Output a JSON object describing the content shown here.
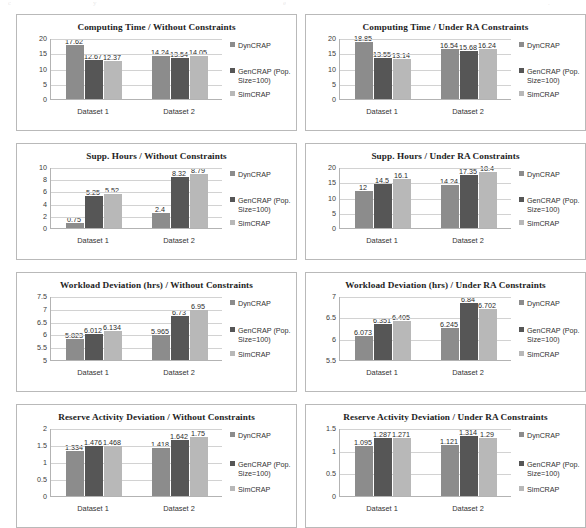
{
  "figure": {
    "name": "grouped-bar-chart-matrix",
    "panel_count": 8,
    "series_names": [
      "DynCRAP",
      "GenCRAP (Pop. Size=100)",
      "SimCRAP"
    ],
    "series_colors": [
      "#8c8c8c",
      "#565656",
      "#b8b8b8"
    ],
    "categories": [
      "Dataset 1",
      "Dataset 2"
    ]
  },
  "scan_artifacts": [
    "c",
    "y",
    "e",
    "."
  ],
  "charts": [
    {
      "type": "bar",
      "title": "Computing Time / Without Constraints",
      "categories": [
        "Dataset 1",
        "Dataset 2"
      ],
      "series": [
        {
          "name": "DynCRAP",
          "values": [
            17.62,
            14.24
          ]
        },
        {
          "name": "GenCRAP (Pop. Size=100)",
          "values": [
            12.67,
            13.54
          ]
        },
        {
          "name": "SimCRAP",
          "values": [
            12.37,
            14.05
          ]
        }
      ],
      "labels": [
        [
          "17.62",
          "12.67",
          "12.37"
        ],
        [
          "14.24",
          "13.54",
          "14.05"
        ]
      ],
      "yticks": [
        "0",
        "5",
        "10",
        "15",
        "20"
      ],
      "ytick_values": [
        0,
        5,
        10,
        15,
        20
      ],
      "ylim": [
        0,
        20
      ],
      "xlabel": "",
      "ylabel": "",
      "grid": true,
      "legend_position": "right"
    },
    {
      "type": "bar",
      "title": "Computing Time / Under RA Constraints",
      "categories": [
        "Dataset 1",
        "Dataset 2"
      ],
      "series": [
        {
          "name": "DynCRAP",
          "values": [
            18.85,
            16.54
          ]
        },
        {
          "name": "GenCRAP (Pop. Size=100)",
          "values": [
            13.55,
            15.68
          ]
        },
        {
          "name": "SimCRAP",
          "values": [
            13.14,
            16.24
          ]
        }
      ],
      "labels": [
        [
          "18.85",
          "13.55",
          "13.14"
        ],
        [
          "16.54",
          "15.68",
          "16.24"
        ]
      ],
      "yticks": [
        "0",
        "5",
        "10",
        "15",
        "20"
      ],
      "ytick_values": [
        0,
        5,
        10,
        15,
        20
      ],
      "ylim": [
        0,
        20
      ],
      "xlabel": "",
      "ylabel": "",
      "grid": true,
      "legend_position": "right"
    },
    {
      "type": "bar",
      "title": "Supp. Hours / Without Constraints",
      "categories": [
        "Dataset 1",
        "Dataset 2"
      ],
      "series": [
        {
          "name": "DynCRAP",
          "values": [
            0.75,
            2.4
          ]
        },
        {
          "name": "GenCRAP (Pop. Size=100)",
          "values": [
            5.25,
            8.32
          ]
        },
        {
          "name": "SimCRAP",
          "values": [
            5.52,
            8.79
          ]
        }
      ],
      "labels": [
        [
          "0.75",
          "5.25",
          "5.52"
        ],
        [
          "2.4",
          "8.32",
          "8.79"
        ]
      ],
      "yticks": [
        "0",
        "2",
        "4",
        "6",
        "8",
        "10"
      ],
      "ytick_values": [
        0,
        2,
        4,
        6,
        8,
        10
      ],
      "ylim": [
        0,
        10
      ],
      "xlabel": "",
      "ylabel": "",
      "grid": true,
      "legend_position": "right"
    },
    {
      "type": "bar",
      "title": "Supp. Hours / Under RA Constraints",
      "categories": [
        "Dataset 1",
        "Dataset 2"
      ],
      "series": [
        {
          "name": "DynCRAP",
          "values": [
            12,
            14.24
          ]
        },
        {
          "name": "GenCRAP (Pop. Size=100)",
          "values": [
            14.5,
            17.35
          ]
        },
        {
          "name": "SimCRAP",
          "values": [
            16.1,
            18.4
          ]
        }
      ],
      "labels": [
        [
          "12",
          "14.5",
          "16.1"
        ],
        [
          "14.24",
          "17.35",
          "18.4"
        ]
      ],
      "yticks": [
        "0",
        "5",
        "10",
        "15",
        "20"
      ],
      "ytick_values": [
        0,
        5,
        10,
        15,
        20
      ],
      "ylim": [
        0,
        20
      ],
      "xlabel": "",
      "ylabel": "",
      "grid": true,
      "legend_position": "right"
    },
    {
      "type": "bar",
      "title": "Workload Deviation (hrs) / Without Constraints",
      "categories": [
        "Dataset 1",
        "Dataset 2"
      ],
      "series": [
        {
          "name": "DynCRAP",
          "values": [
            5.823,
            5.965
          ]
        },
        {
          "name": "GenCRAP (Pop. Size=100)",
          "values": [
            6.012,
            6.73
          ]
        },
        {
          "name": "SimCRAP",
          "values": [
            6.134,
            6.95
          ]
        }
      ],
      "labels": [
        [
          "5.823",
          "6.012",
          "6.134"
        ],
        [
          "5.965",
          "6.73",
          "6.95"
        ]
      ],
      "yticks": [
        "5",
        "5.5",
        "6",
        "6.5",
        "7",
        "7.5"
      ],
      "ytick_values": [
        5,
        5.5,
        6,
        6.5,
        7,
        7.5
      ],
      "ylim": [
        5,
        7.5
      ],
      "xlabel": "",
      "ylabel": "",
      "grid": true,
      "legend_position": "right"
    },
    {
      "type": "bar",
      "title": "Workload Deviation (hrs) / Under RA Constraints",
      "categories": [
        "Dataset 1",
        "Dataset 2"
      ],
      "series": [
        {
          "name": "DynCRAP",
          "values": [
            6.073,
            6.245
          ]
        },
        {
          "name": "GenCRAP (Pop. Size=100)",
          "values": [
            6.351,
            6.84
          ]
        },
        {
          "name": "SimCRAP",
          "values": [
            6.405,
            6.702
          ]
        }
      ],
      "labels": [
        [
          "6.073",
          "6.351",
          "6.405"
        ],
        [
          "6.245",
          "6.84",
          "6.702"
        ]
      ],
      "yticks": [
        "5.5",
        "6",
        "6.5",
        "7"
      ],
      "ytick_values": [
        5.5,
        6,
        6.5,
        7
      ],
      "ylim": [
        5.5,
        7
      ],
      "xlabel": "",
      "ylabel": "",
      "grid": true,
      "legend_position": "right"
    },
    {
      "type": "bar",
      "title": "Reserve Activity Deviation / Without Constraints",
      "categories": [
        "Dataset 1",
        "Dataset 2"
      ],
      "series": [
        {
          "name": "DynCRAP",
          "values": [
            1.334,
            1.418
          ]
        },
        {
          "name": "GenCRAP (Pop. Size=100)",
          "values": [
            1.476,
            1.642
          ]
        },
        {
          "name": "SimCRAP",
          "values": [
            1.468,
            1.75
          ]
        }
      ],
      "labels": [
        [
          "1.334",
          "1.476",
          "1.468"
        ],
        [
          "1.418",
          "1.642",
          "1.75"
        ]
      ],
      "yticks": [
        "0",
        "0.5",
        "1",
        "1.5",
        "2"
      ],
      "ytick_values": [
        0,
        0.5,
        1,
        1.5,
        2
      ],
      "ylim": [
        0,
        2
      ],
      "xlabel": "",
      "ylabel": "",
      "grid": true,
      "legend_position": "right"
    },
    {
      "type": "bar",
      "title": "Reserve Activity Deviation / Under RA Constraints",
      "categories": [
        "Dataset 1",
        "Dataset 2"
      ],
      "series": [
        {
          "name": "DynCRAP",
          "values": [
            1.095,
            1.121
          ]
        },
        {
          "name": "GenCRAP (Pop. Size=100)",
          "values": [
            1.287,
            1.314
          ]
        },
        {
          "name": "SimCRAP",
          "values": [
            1.271,
            1.29
          ]
        }
      ],
      "labels": [
        [
          "1.095",
          "1.287",
          "1.271"
        ],
        [
          "1.121",
          "1.314",
          "1.29"
        ]
      ],
      "yticks": [
        "0",
        "0.5",
        "1",
        "1.5"
      ],
      "ytick_values": [
        0,
        0.5,
        1,
        1.5
      ],
      "ylim": [
        0,
        1.5
      ],
      "xlabel": "",
      "ylabel": "",
      "grid": true,
      "legend_position": "right"
    }
  ],
  "chart_data": {
    "type": "bar",
    "categories": [
      "Dataset 1",
      "Dataset 2"
    ],
    "legend_position": "right",
    "grid": true,
    "panels": [
      {
        "title": "Computing Time / Without Constraints",
        "ylim": [
          0,
          20
        ],
        "yticks": [
          0,
          5,
          10,
          15,
          20
        ],
        "series": [
          {
            "name": "DynCRAP",
            "values": [
              17.62,
              14.24
            ]
          },
          {
            "name": "GenCRAP (Pop. Size=100)",
            "values": [
              12.67,
              13.54
            ]
          },
          {
            "name": "SimCRAP",
            "values": [
              12.37,
              14.05
            ]
          }
        ]
      },
      {
        "title": "Computing Time / Under RA Constraints",
        "ylim": [
          0,
          20
        ],
        "yticks": [
          0,
          5,
          10,
          15,
          20
        ],
        "series": [
          {
            "name": "DynCRAP",
            "values": [
              18.85,
              16.54
            ]
          },
          {
            "name": "GenCRAP (Pop. Size=100)",
            "values": [
              13.55,
              15.68
            ]
          },
          {
            "name": "SimCRAP",
            "values": [
              13.14,
              16.24
            ]
          }
        ]
      },
      {
        "title": "Supp. Hours / Without Constraints",
        "ylim": [
          0,
          10
        ],
        "yticks": [
          0,
          2,
          4,
          6,
          8,
          10
        ],
        "series": [
          {
            "name": "DynCRAP",
            "values": [
              0.75,
              2.4
            ]
          },
          {
            "name": "GenCRAP (Pop. Size=100)",
            "values": [
              5.25,
              8.32
            ]
          },
          {
            "name": "SimCRAP",
            "values": [
              5.52,
              8.79
            ]
          }
        ]
      },
      {
        "title": "Supp. Hours / Under RA Constraints",
        "ylim": [
          0,
          20
        ],
        "yticks": [
          0,
          5,
          10,
          15,
          20
        ],
        "series": [
          {
            "name": "DynCRAP",
            "values": [
              12,
              14.24
            ]
          },
          {
            "name": "GenCRAP (Pop. Size=100)",
            "values": [
              14.5,
              17.35
            ]
          },
          {
            "name": "SimCRAP",
            "values": [
              16.1,
              18.4
            ]
          }
        ]
      },
      {
        "title": "Workload Deviation (hrs) / Without Constraints",
        "ylim": [
          5,
          7.5
        ],
        "yticks": [
          5,
          5.5,
          6,
          6.5,
          7,
          7.5
        ],
        "series": [
          {
            "name": "DynCRAP",
            "values": [
              5.823,
              5.965
            ]
          },
          {
            "name": "GenCRAP (Pop. Size=100)",
            "values": [
              6.012,
              6.73
            ]
          },
          {
            "name": "SimCRAP",
            "values": [
              6.134,
              6.95
            ]
          }
        ]
      },
      {
        "title": "Workload Deviation (hrs) / Under RA Constraints",
        "ylim": [
          5.5,
          7
        ],
        "yticks": [
          5.5,
          6,
          6.5,
          7
        ],
        "series": [
          {
            "name": "DynCRAP",
            "values": [
              6.073,
              6.245
            ]
          },
          {
            "name": "GenCRAP (Pop. Size=100)",
            "values": [
              6.351,
              6.84
            ]
          },
          {
            "name": "SimCRAP",
            "values": [
              6.405,
              6.702
            ]
          }
        ]
      },
      {
        "title": "Reserve Activity Deviation / Without Constraints",
        "ylim": [
          0,
          2
        ],
        "yticks": [
          0,
          0.5,
          1,
          1.5,
          2
        ],
        "series": [
          {
            "name": "DynCRAP",
            "values": [
              1.334,
              1.418
            ]
          },
          {
            "name": "GenCRAP (Pop. Size=100)",
            "values": [
              1.476,
              1.642
            ]
          },
          {
            "name": "SimCRAP",
            "values": [
              1.468,
              1.75
            ]
          }
        ]
      },
      {
        "title": "Reserve Activity Deviation / Under RA Constraints",
        "ylim": [
          0,
          1.5
        ],
        "yticks": [
          0,
          0.5,
          1,
          1.5
        ],
        "series": [
          {
            "name": "DynCRAP",
            "values": [
              1.095,
              1.121
            ]
          },
          {
            "name": "GenCRAP (Pop. Size=100)",
            "values": [
              1.287,
              1.314
            ]
          },
          {
            "name": "SimCRAP",
            "values": [
              1.271,
              1.29
            ]
          }
        ]
      }
    ]
  }
}
